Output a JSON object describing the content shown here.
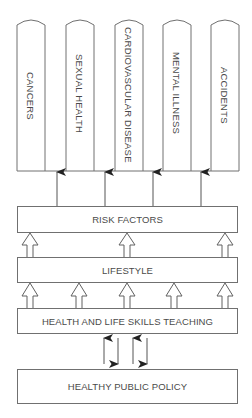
{
  "diagram": {
    "type": "pillars-and-foundation",
    "colors": {
      "stroke": "#707070",
      "text": "#4a4a4a",
      "background": "#ffffff"
    },
    "pillars": [
      {
        "label": "CANCERS"
      },
      {
        "label": "SEXUAL HEALTH"
      },
      {
        "label": "CARDIOVASCULAR DISEASE"
      },
      {
        "label": "MENTAL ILLNESS"
      },
      {
        "label": "ACCIDENTS"
      }
    ],
    "layers": [
      {
        "label": "RISK FACTORS"
      },
      {
        "label": "LIFESTYLE"
      },
      {
        "label": "HEALTH AND LIFE SKILLS TEACHING"
      },
      {
        "label": "HEALTHY PUBLIC POLICY"
      }
    ],
    "connections": [
      {
        "from": "RISK FACTORS",
        "to": "pillars",
        "arrow": "solid-up",
        "count": 4
      },
      {
        "from": "LIFESTYLE",
        "to": "RISK FACTORS",
        "arrow": "hollow-up",
        "count": 3
      },
      {
        "from": "HEALTH AND LIFE SKILLS TEACHING",
        "to": "LIFESTYLE",
        "arrow": "hollow-up",
        "count": 5
      },
      {
        "between": [
          "HEALTH AND LIFE SKILLS TEACHING",
          "HEALTHY PUBLIC POLICY"
        ],
        "arrow": "alternating-up-down",
        "count": 4
      }
    ]
  }
}
